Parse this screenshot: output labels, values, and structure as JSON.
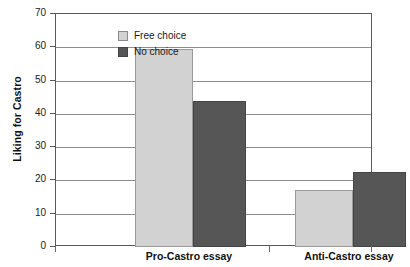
{
  "chart_data": {
    "type": "bar",
    "title": "",
    "xlabel": "",
    "ylabel": "Liking for Castro",
    "categories": [
      "Pro-Castro essay",
      "Anti-Castro essay"
    ],
    "series": [
      {
        "name": "Free choice",
        "color": "#d2d2d2",
        "values": [
          59.5,
          17
        ]
      },
      {
        "name": "No choice",
        "color": "#565656",
        "values": [
          44,
          22.5
        ]
      }
    ],
    "ylim": [
      0,
      70
    ],
    "ytick_step": 10,
    "yticks": [
      "0",
      "10",
      "20",
      "30",
      "40",
      "50",
      "60",
      "70"
    ],
    "grid": "horizontal",
    "legend_position": "top-left-inside",
    "frame_color": "#5a5a5a"
  },
  "legend": {
    "items": [
      {
        "label": "Free choice",
        "swatch": "legend-swatch-free-choice"
      },
      {
        "label": "No choice",
        "swatch": "legend-swatch-no-choice"
      }
    ]
  }
}
